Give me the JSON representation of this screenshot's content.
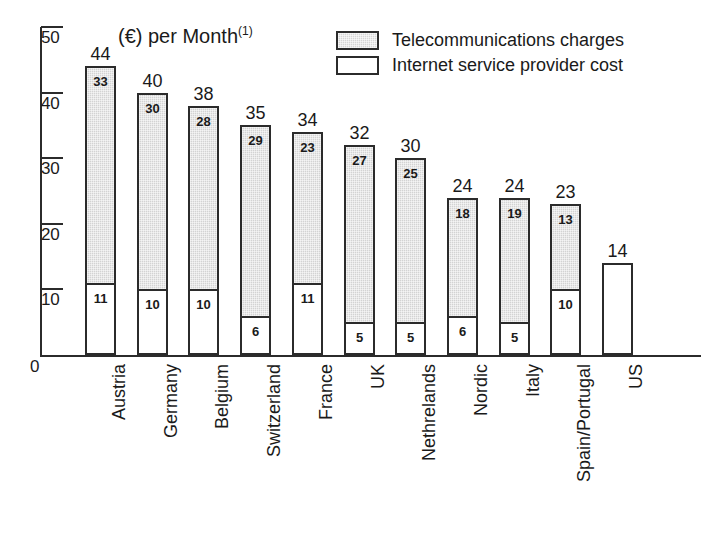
{
  "chart_data": {
    "type": "bar",
    "subtype": "stacked-bar",
    "title": "(€) per Month",
    "title_footnote": "(1)",
    "xlabel": "",
    "ylabel": "",
    "ylim": [
      0,
      50
    ],
    "yticks": [
      10,
      20,
      30,
      40,
      50
    ],
    "ytick_labels": [
      "10",
      "20",
      "30",
      "40",
      "50"
    ],
    "y_zero_label": "0",
    "grid": false,
    "legend_position": "top-right",
    "categories": [
      "Austria",
      "Germany",
      "Belgium",
      "Switzerland",
      "France",
      "UK",
      "Nethrelands",
      "Nordic",
      "Italy",
      "Spain/Portugal",
      "US"
    ],
    "series": [
      {
        "name": "Internet service provider cost",
        "color": "#ffffff",
        "values": [
          11,
          10,
          10,
          6,
          11,
          5,
          5,
          6,
          5,
          10,
          14
        ]
      },
      {
        "name": "Telecommunications charges",
        "color": "#d3d3d3",
        "values": [
          33,
          30,
          28,
          29,
          23,
          27,
          25,
          18,
          19,
          13,
          0
        ]
      }
    ],
    "totals": [
      44,
      40,
      38,
      35,
      34,
      32,
      30,
      24,
      24,
      23,
      14
    ],
    "bar_labels": {
      "telecom": [
        "33",
        "30",
        "28",
        "29",
        "23",
        "27",
        "25",
        "18",
        "19",
        "13",
        ""
      ],
      "isp": [
        "11",
        "10",
        "10",
        "6",
        "11",
        "5",
        "5",
        "6",
        "5",
        "10",
        ""
      ],
      "total": [
        "44",
        "40",
        "38",
        "35",
        "34",
        "32",
        "30",
        "24",
        "24",
        "23",
        "14"
      ]
    }
  },
  "legend": {
    "items": [
      {
        "label": "Telecommunications charges",
        "swatch": "shaded"
      },
      {
        "label": "Internet service provider cost",
        "swatch": "white"
      }
    ]
  }
}
